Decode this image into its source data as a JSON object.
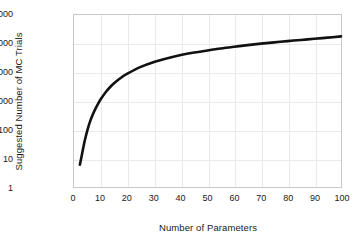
{
  "chart_data": {
    "type": "line",
    "title": "",
    "xlabel": "Number of Parameters",
    "ylabel": "Suggested Number of MC Trials",
    "xlim": [
      0,
      100
    ],
    "ylim": [
      1,
      1000000
    ],
    "yscale": "log",
    "xscale": "linear",
    "grid": true,
    "legend": null,
    "xticks": [
      0,
      10,
      20,
      30,
      40,
      50,
      60,
      70,
      80,
      90,
      100
    ],
    "xtick_labels": [
      "0",
      "10",
      "20",
      "30",
      "40",
      "50",
      "60",
      "70",
      "80",
      "90",
      "100"
    ],
    "yticks": [
      1,
      10,
      100,
      1000,
      10000,
      100000,
      1000000
    ],
    "ytick_labels": [
      "1",
      "10",
      "100",
      "1000",
      "10000",
      "100000",
      "1000000"
    ],
    "series": [
      {
        "name": "Suggested MC Trials",
        "color": "#111111",
        "linewidth": 2.6,
        "x": [
          2.2,
          3,
          4,
          5,
          6,
          7,
          8,
          9,
          10,
          12,
          14,
          16,
          18,
          20,
          25,
          30,
          35,
          40,
          45,
          50,
          55,
          60,
          65,
          70,
          75,
          80,
          85,
          90,
          95,
          100
        ],
        "y": [
          6,
          14,
          40,
          95,
          190,
          330,
          530,
          800,
          1150,
          2100,
          3400,
          5000,
          6900,
          9000,
          15500,
          23000,
          31000,
          40000,
          49000,
          58000,
          68000,
          78000,
          89000,
          100000,
          111000,
          123000,
          135000,
          148000,
          162000,
          180000
        ]
      }
    ]
  },
  "axis": {
    "x_title": "Number of Parameters",
    "y_title": "Suggested Number of MC Trials"
  },
  "style": {
    "background": "#ffffff",
    "grid_color": "#e9e9e9",
    "frame_color": "#c9c9c9",
    "curve_color": "#111111",
    "text_color": "#1a1a1a"
  }
}
